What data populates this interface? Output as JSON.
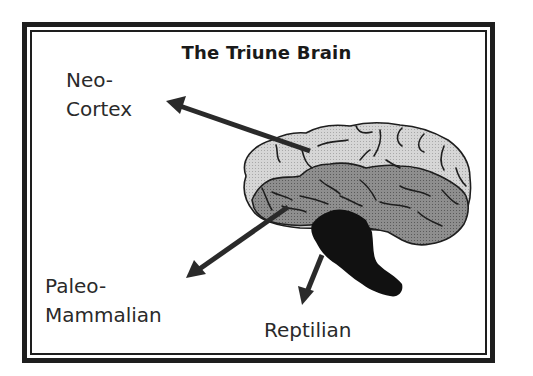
{
  "diagram": {
    "title": "The Triune Brain",
    "labels": {
      "neocortex": {
        "line1": "Neo-",
        "line2": "Cortex"
      },
      "paleomammalian": {
        "line1": "Paleo-",
        "line2": "Mammalian"
      },
      "reptilian": {
        "line1": "Reptilian"
      }
    },
    "regions": [
      {
        "name": "Neo-Cortex",
        "fill": "#cfcfcf",
        "position": "outer top layer"
      },
      {
        "name": "Paleo-Mammalian",
        "fill": "#8a8a8a",
        "position": "middle layer"
      },
      {
        "name": "Reptilian",
        "fill": "#111111",
        "position": "brainstem"
      }
    ],
    "arrows": [
      {
        "from": "neocortex-region",
        "to": "neocortex-label"
      },
      {
        "from": "paleomammalian-region",
        "to": "paleomammalian-label"
      },
      {
        "from": "reptilian-region",
        "to": "reptilian-label"
      }
    ],
    "colors": {
      "frame": "#1e1e1e",
      "arrow": "#2a2a2a",
      "text": "#2a2a2a"
    }
  }
}
